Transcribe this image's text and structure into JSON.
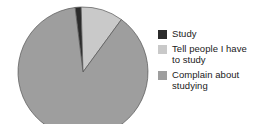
{
  "chart_data": {
    "type": "pie",
    "title": "",
    "categories": [
      "Study",
      "Tell people I have to study",
      "Complain about studying"
    ],
    "values": [
      1.5,
      10.5,
      88
    ],
    "unit": "percent",
    "legend_position": "right",
    "grid": false,
    "colors": [
      "#2b2b2b",
      "#c9c9c9",
      "#9e9e9e"
    ],
    "background": "#ffffff",
    "start_angle_deg": -7,
    "direction": "clockwise",
    "slices": [
      {
        "label": "Study",
        "value": 1.5,
        "angle_deg": 5.4,
        "color": "#2b2b2b"
      },
      {
        "label": "Tell people I have to study",
        "value": 10.5,
        "angle_deg": 37.8,
        "color": "#c9c9c9"
      },
      {
        "label": "Complain about studying",
        "value": 88,
        "angle_deg": 316.8,
        "color": "#9e9e9e"
      }
    ]
  },
  "legend": {
    "items": [
      {
        "label": "Study",
        "color": "#2b2b2b"
      },
      {
        "label": "Tell people I have\nto study",
        "color": "#c9c9c9"
      },
      {
        "label": "Complain about\nstudying",
        "color": "#9e9e9e"
      }
    ]
  }
}
